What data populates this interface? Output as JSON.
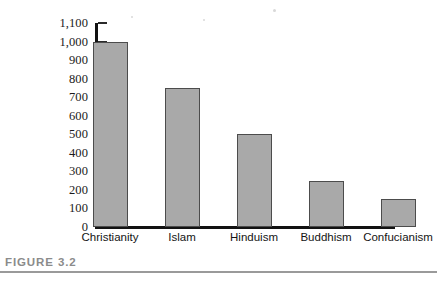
{
  "caption": {
    "label": "FIGURE 3.2",
    "rule_color": "#9a9a9a",
    "text_color": "#8b8b8b"
  },
  "chart_data": {
    "type": "bar",
    "title": "",
    "subtitle": "",
    "xlabel": "",
    "ylabel": "",
    "categories": [
      "Christianity",
      "Islam",
      "Hinduism",
      "Buddhism",
      "Confucianism"
    ],
    "values": [
      1000,
      750,
      500,
      250,
      150
    ],
    "ylim": [
      0,
      1100
    ],
    "ytick_step": 100,
    "ytick_labels": [
      "1,100",
      "1,000",
      "900",
      "800",
      "700",
      "600",
      "500",
      "400",
      "300",
      "200",
      "100",
      "0"
    ],
    "ytick_values": [
      1100,
      1000,
      900,
      800,
      700,
      600,
      500,
      400,
      300,
      200,
      100,
      0
    ],
    "grid": false,
    "legend": null,
    "legend_position": "none",
    "bar_fill": "#a9a9a9",
    "bar_border": "#4c4c4c",
    "axis_color": "#121212"
  }
}
